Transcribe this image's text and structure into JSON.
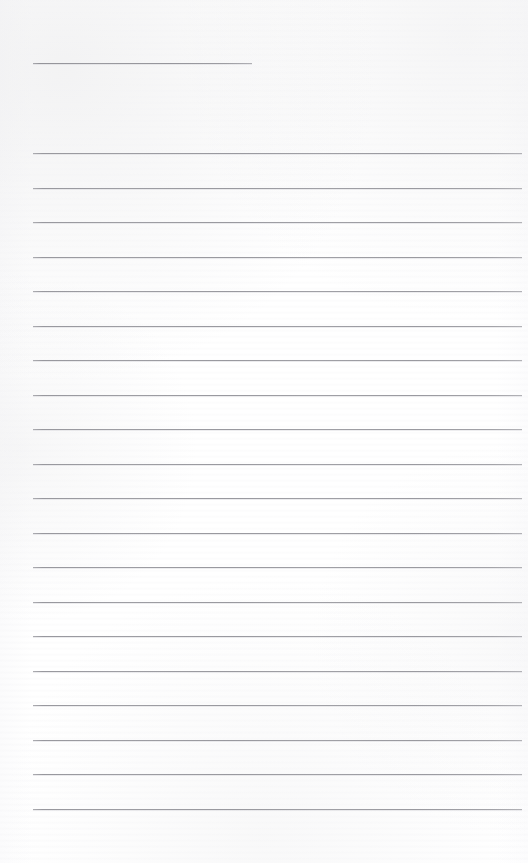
{
  "document": {
    "kind": "scanned-page",
    "title": "Blank lined notepad page",
    "page_width": 528,
    "page_height": 863,
    "paper_color": "#fefefe",
    "rule_color": "#b9b9bd",
    "content_text": "",
    "note": "Page contains no written or printed text — only ruled lines."
  },
  "layout": {
    "left_margin_x": 33,
    "right_margin_x": 522,
    "first_line_y": 63,
    "body_start_y": 153,
    "line_spacing": 34.5,
    "bottom_margin_y": 808
  },
  "rules": [
    {
      "name": "heading-rule",
      "x": 33,
      "y": 63,
      "width": 219,
      "kind": "short"
    },
    {
      "name": "body-rule-1",
      "x": 33,
      "y": 153,
      "width": 489,
      "kind": "full"
    },
    {
      "name": "body-rule-2",
      "x": 33,
      "y": 187.5,
      "width": 489,
      "kind": "full"
    },
    {
      "name": "body-rule-3",
      "x": 33,
      "y": 222,
      "width": 489,
      "kind": "full"
    },
    {
      "name": "body-rule-4",
      "x": 33,
      "y": 256.5,
      "width": 489,
      "kind": "full"
    },
    {
      "name": "body-rule-5",
      "x": 33,
      "y": 291,
      "width": 489,
      "kind": "full"
    },
    {
      "name": "body-rule-6",
      "x": 33,
      "y": 325.5,
      "width": 489,
      "kind": "full"
    },
    {
      "name": "body-rule-7",
      "x": 33,
      "y": 360,
      "width": 489,
      "kind": "full"
    },
    {
      "name": "body-rule-8",
      "x": 33,
      "y": 394.5,
      "width": 489,
      "kind": "full"
    },
    {
      "name": "body-rule-9",
      "x": 33,
      "y": 429,
      "width": 489,
      "kind": "full"
    },
    {
      "name": "body-rule-10",
      "x": 33,
      "y": 463.5,
      "width": 489,
      "kind": "full"
    },
    {
      "name": "body-rule-11",
      "x": 33,
      "y": 498,
      "width": 489,
      "kind": "full"
    },
    {
      "name": "body-rule-12",
      "x": 33,
      "y": 532.5,
      "width": 489,
      "kind": "full"
    },
    {
      "name": "body-rule-13",
      "x": 33,
      "y": 567,
      "width": 489,
      "kind": "full"
    },
    {
      "name": "body-rule-14",
      "x": 33,
      "y": 601.5,
      "width": 489,
      "kind": "full"
    },
    {
      "name": "body-rule-15",
      "x": 33,
      "y": 636,
      "width": 489,
      "kind": "full"
    },
    {
      "name": "body-rule-16",
      "x": 33,
      "y": 670.5,
      "width": 489,
      "kind": "full"
    },
    {
      "name": "body-rule-17",
      "x": 33,
      "y": 705,
      "width": 489,
      "kind": "full"
    },
    {
      "name": "body-rule-18",
      "x": 33,
      "y": 739.5,
      "width": 489,
      "kind": "full"
    },
    {
      "name": "body-rule-19",
      "x": 33,
      "y": 774,
      "width": 489,
      "kind": "full"
    },
    {
      "name": "body-rule-20",
      "x": 33,
      "y": 808.5,
      "width": 489,
      "kind": "full"
    }
  ]
}
